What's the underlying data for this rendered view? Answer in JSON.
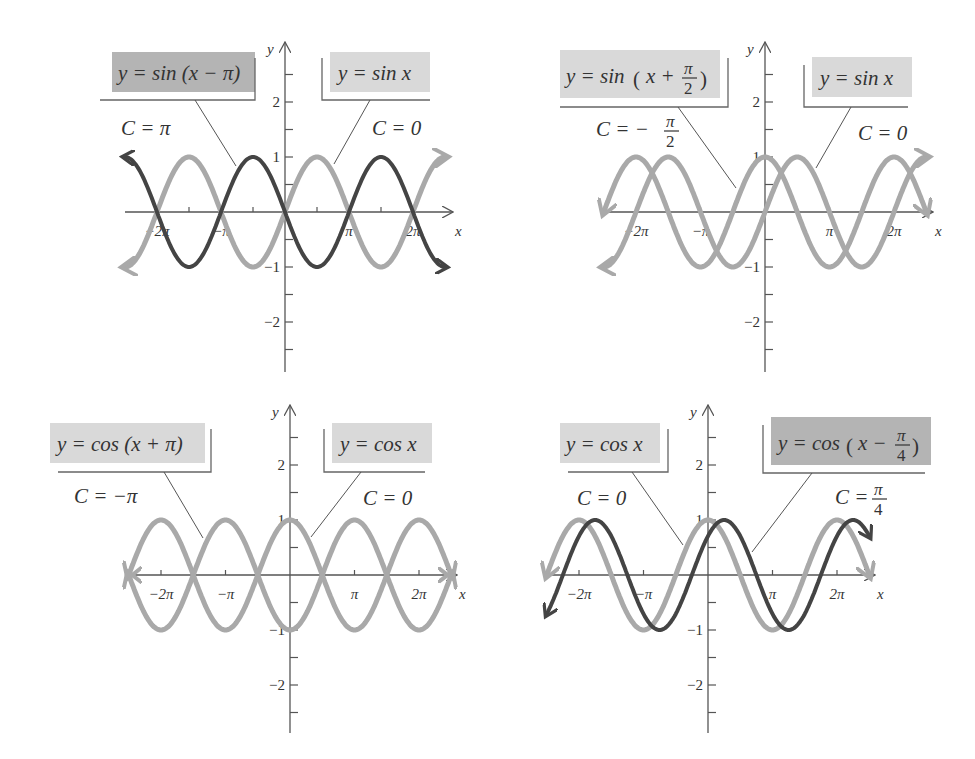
{
  "chart_data": [
    {
      "type": "line",
      "title": "Horizontal shift of y = sin x by C = π",
      "xlabel": "x",
      "ylabel": "y",
      "xlim": [
        -2.5,
        2.65
      ],
      "ylim": [
        -3,
        3
      ],
      "x_unit": "π",
      "x_ticks": [
        "−2π",
        "−π",
        "π",
        "2π"
      ],
      "y_ticks": [
        "−2",
        "−1",
        "1",
        "2"
      ],
      "grid": false,
      "series": [
        {
          "name": "y = sin x",
          "label": "C = 0",
          "formula": "sin(x)",
          "shift": 0,
          "style": "light"
        },
        {
          "name": "y = sin (x − π)",
          "label": "C = π",
          "formula": "sin(x - π)",
          "shift": 3.14159,
          "style": "dark"
        }
      ]
    },
    {
      "type": "line",
      "title": "Horizontal shift of y = sin x by C = −π/2",
      "xlabel": "x",
      "ylabel": "y",
      "xlim": [
        -2.5,
        2.65
      ],
      "ylim": [
        -3,
        3
      ],
      "x_unit": "π",
      "x_ticks": [
        "−2π",
        "−π",
        "π",
        "2π"
      ],
      "y_ticks": [
        "−2",
        "−1",
        "1",
        "2"
      ],
      "grid": false,
      "series": [
        {
          "name": "y = sin x",
          "label": "C = 0",
          "formula": "sin(x)",
          "shift": 0,
          "style": "light"
        },
        {
          "name": "y = sin (x + π/2)",
          "label": "C = −π/2",
          "formula": "sin(x + π/2)",
          "shift": -1.5708,
          "style": "light"
        }
      ]
    },
    {
      "type": "line",
      "title": "Horizontal shift of y = cos x by C = −π",
      "xlabel": "x",
      "ylabel": "y",
      "xlim": [
        -2.5,
        2.65
      ],
      "ylim": [
        -3,
        3
      ],
      "x_unit": "π",
      "x_ticks": [
        "−2π",
        "−π",
        "π",
        "2π"
      ],
      "y_ticks": [
        "−2",
        "−1",
        "1",
        "2"
      ],
      "grid": false,
      "series": [
        {
          "name": "y = cos x",
          "label": "C = 0",
          "formula": "cos(x)",
          "shift": 0,
          "style": "light"
        },
        {
          "name": "y = cos (x + π)",
          "label": "C = −π",
          "formula": "cos(x + π)",
          "shift": -3.14159,
          "style": "light"
        }
      ]
    },
    {
      "type": "line",
      "title": "Horizontal shift of y = cos x by C = π/4",
      "xlabel": "x",
      "ylabel": "y",
      "xlim": [
        -2.5,
        2.65
      ],
      "ylim": [
        -3,
        3
      ],
      "x_unit": "π",
      "x_ticks": [
        "−2π",
        "−π",
        "π",
        "2π"
      ],
      "y_ticks": [
        "−2",
        "−1",
        "1",
        "2"
      ],
      "grid": false,
      "series": [
        {
          "name": "y = cos x",
          "label": "C = 0",
          "formula": "cos(x)",
          "shift": 0,
          "style": "light"
        },
        {
          "name": "y = cos (x − π/4)",
          "label": "C = π/4",
          "formula": "cos(x - π/4)",
          "shift": 0.7854,
          "style": "dark"
        }
      ]
    }
  ],
  "panels": [
    {
      "id": "tl",
      "origin": [
        285,
        212
      ],
      "unit_x": 64,
      "unit_y": 55,
      "x_range_px": [
        125,
        453
      ],
      "y_range_px": [
        42,
        372
      ],
      "axis_labels": {
        "x": "x",
        "y": "y"
      },
      "tick_labels": {
        "xneg2": "−2π",
        "xneg1": "−π",
        "x1": "π",
        "x2": "2π",
        "y2": "2",
        "y1": "1",
        "yneg1": "−1",
        "yneg2": "−2"
      },
      "labels": {
        "left_eq": "y = sin (x − π)",
        "left_c": "C = π",
        "right_eq": "y = sin x",
        "right_c": "C = 0"
      }
    },
    {
      "id": "tr",
      "origin": [
        765,
        212
      ],
      "unit_x": 64.5,
      "unit_y": 55,
      "x_range_px": [
        602,
        933
      ],
      "y_range_px": [
        42,
        372
      ],
      "axis_labels": {
        "x": "x",
        "y": "y"
      },
      "tick_labels": {
        "xneg2": "−2π",
        "xneg1": "−π",
        "x1": "π",
        "x2": "2π",
        "y2": "2",
        "y1": "1",
        "yneg1": "−1",
        "yneg2": "−2"
      },
      "labels": {
        "left_eq_prefix": "y = sin",
        "left_eq_x": "x +",
        "left_eq_num": "π",
        "left_eq_den": "2",
        "left_c_prefix": "C = −",
        "left_c_num": "π",
        "left_c_den": "2",
        "right_eq": "y = sin x",
        "right_c": "C = 0"
      }
    },
    {
      "id": "bl",
      "origin": [
        290,
        575
      ],
      "unit_x": 64.5,
      "unit_y": 55,
      "x_range_px": [
        128,
        457
      ],
      "y_range_px": [
        405,
        733
      ],
      "axis_labels": {
        "x": "x",
        "y": "y"
      },
      "tick_labels": {
        "xneg2": "−2π",
        "xneg1": "−π",
        "x1": "π",
        "x2": "2π",
        "y2": "2",
        "y1": "1",
        "yneg1": "−1",
        "yneg2": "−2"
      },
      "labels": {
        "left_eq": "y = cos (x + π)",
        "left_c": "C = −π",
        "right_eq": "y = cos x",
        "right_c": "C = 0"
      }
    },
    {
      "id": "br",
      "origin": [
        708,
        575
      ],
      "unit_x": 64.5,
      "unit_y": 55,
      "x_range_px": [
        548,
        875
      ],
      "y_range_px": [
        405,
        733
      ],
      "axis_labels": {
        "x": "x",
        "y": "y"
      },
      "tick_labels": {
        "xneg2": "−2π",
        "xneg1": "−π",
        "x1": "π",
        "x2": "2π",
        "y2": "2",
        "y1": "1",
        "yneg1": "−1",
        "yneg2": "−2"
      },
      "labels": {
        "left_eq": "y = cos x",
        "left_c": "C = 0",
        "right_eq_prefix": "y = cos",
        "right_eq_x": "x −",
        "right_eq_num": "π",
        "right_eq_den": "4",
        "right_c_prefix": "C =",
        "right_c_num": "π",
        "right_c_den": "4"
      }
    }
  ],
  "colors": {
    "light_curve": "#a9a9a9",
    "dark_curve": "#444444",
    "box_light": "#d9d9d9",
    "box_dark": "#b4b4b4",
    "axis": "#555555"
  }
}
